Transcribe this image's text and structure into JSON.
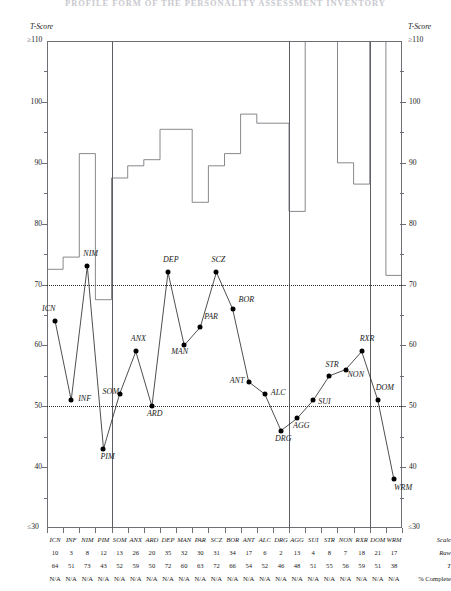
{
  "title": "PROFILE FORM OF THE PERSONALITY ASSESSMENT INVENTORY",
  "axis": {
    "label_left": "T-Score",
    "label_right": "T-Score",
    "top_label": "≥110",
    "bottom_label": "≤30",
    "ticks": [
      "100",
      "90",
      "80",
      "70",
      "60",
      "50",
      "40"
    ],
    "tick_values": [
      100,
      90,
      80,
      70,
      60,
      50,
      40
    ],
    "min": 30,
    "max": 110,
    "reference_lines": [
      70,
      50
    ]
  },
  "row_headers": {
    "scale": "Scale",
    "raw": "Raw",
    "t": "T",
    "complete": "% Complete"
  },
  "chart_data": {
    "type": "line",
    "title": "PROFILE FORM OF THE PERSONALITY ASSESSMENT INVENTORY",
    "xlabel": "Scale",
    "ylabel": "T-Score",
    "ylim": [
      30,
      110
    ],
    "grid": false,
    "legend": "none",
    "categories": [
      "ICN",
      "INF",
      "NIM",
      "PIM",
      "SOM",
      "ANX",
      "ARD",
      "DEP",
      "MAN",
      "PAR",
      "SCZ",
      "BOR",
      "ANT",
      "ALC",
      "DRG",
      "AGG",
      "SUI",
      "STR",
      "NON",
      "RXR",
      "DOM",
      "WRM"
    ],
    "series": [
      {
        "name": "T",
        "values": [
          64,
          51,
          73,
          43,
          52,
          59,
          50,
          72,
          60,
          63,
          72,
          66,
          54,
          52,
          46,
          48,
          51,
          55,
          56,
          59,
          51,
          38
        ]
      }
    ],
    "raw_scores": [
      10,
      3,
      8,
      12,
      13,
      26,
      20,
      35,
      32,
      30,
      31,
      34,
      17,
      6,
      2,
      13,
      4,
      8,
      7,
      18,
      21,
      17
    ],
    "percent_complete": [
      "N/A",
      "N/A",
      "N/A",
      "N/A",
      "N/A",
      "N/A",
      "N/A",
      "N/A",
      "N/A",
      "N/A",
      "N/A",
      "N/A",
      "N/A",
      "N/A",
      "N/A",
      "N/A",
      "N/A",
      "N/A",
      "N/A",
      "N/A",
      "N/A",
      "N/A"
    ],
    "skyline_profile": [
      72.5,
      74.5,
      91.5,
      67.5,
      87.5,
      89.5,
      90.5,
      95.5,
      95.5,
      83.5,
      89.5,
      91.5,
      98.0,
      96.5,
      96.5,
      82.0,
      110.0,
      110.0,
      90.0,
      86.5,
      110.0,
      71.5
    ],
    "group_dividers_after": [
      "PIM",
      "DRG",
      "RXR"
    ],
    "annotations": [
      "Dotted reference lines at T=70 and T=50",
      "Skyline step profile across top of chart"
    ]
  }
}
